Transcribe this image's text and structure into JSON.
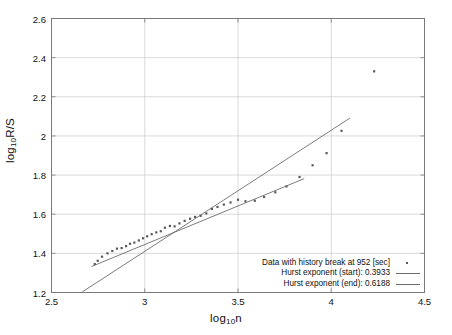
{
  "chart_data": {
    "type": "scatter",
    "title": "",
    "xlabel": "log10n",
    "ylabel": "log10R/S",
    "xlim": [
      2.5,
      4.5
    ],
    "ylim": [
      1.2,
      2.6
    ],
    "xticks": [
      "2.5",
      "3",
      "3.5",
      "4",
      "4.5"
    ],
    "xtick_values": [
      2.5,
      3,
      3.5,
      4,
      4.5
    ],
    "yticks": [
      "1.2",
      "1.4",
      "1.6",
      "1.8",
      "2",
      "2.2",
      "2.4",
      "2.6"
    ],
    "ytick_values": [
      1.2,
      1.4,
      1.6,
      1.8,
      2.0,
      2.2,
      2.4,
      2.6
    ],
    "grid": true,
    "legend_position": "lower right",
    "marker_color": "#5a5a5a",
    "line_color": "#6d6d6d",
    "series": [
      {
        "name": "Data with history break at 952 [sec]",
        "type": "scatter",
        "marker": "square-dot",
        "points": [
          [
            2.732,
            1.345
          ],
          [
            2.748,
            1.362
          ],
          [
            2.771,
            1.383
          ],
          [
            2.8,
            1.4
          ],
          [
            2.826,
            1.412
          ],
          [
            2.851,
            1.424
          ],
          [
            2.876,
            1.427
          ],
          [
            2.9,
            1.437
          ],
          [
            2.921,
            1.449
          ],
          [
            2.944,
            1.455
          ],
          [
            2.968,
            1.466
          ],
          [
            2.991,
            1.477
          ],
          [
            3.013,
            1.487
          ],
          [
            3.037,
            1.498
          ],
          [
            3.062,
            1.507
          ],
          [
            3.086,
            1.513
          ],
          [
            3.108,
            1.531
          ],
          [
            3.135,
            1.54
          ],
          [
            3.16,
            1.538
          ],
          [
            3.186,
            1.553
          ],
          [
            3.214,
            1.566
          ],
          [
            3.243,
            1.577
          ],
          [
            3.27,
            1.586
          ],
          [
            3.3,
            1.592
          ],
          [
            3.33,
            1.604
          ],
          [
            3.36,
            1.627
          ],
          [
            3.39,
            1.637
          ],
          [
            3.424,
            1.649
          ],
          [
            3.46,
            1.66
          ],
          [
            3.5,
            1.674
          ],
          [
            3.54,
            1.666
          ],
          [
            3.59,
            1.669
          ],
          [
            3.64,
            1.688
          ],
          [
            3.7,
            1.712
          ],
          [
            3.76,
            1.742
          ],
          [
            3.83,
            1.79
          ],
          [
            3.9,
            1.85
          ],
          [
            3.975,
            1.912
          ],
          [
            4.055,
            2.026
          ],
          [
            4.23,
            2.33
          ]
        ]
      },
      {
        "name": "Hurst exponent (start): 0.3933",
        "type": "line",
        "slope": 0.3933,
        "segment": [
          [
            2.715,
            1.333
          ],
          [
            3.855,
            1.782
          ]
        ]
      },
      {
        "name": "Hurst exponent (end): 0.6188",
        "type": "line",
        "slope": 0.6188,
        "segment": [
          [
            2.665,
            1.203
          ],
          [
            4.1,
            2.091
          ]
        ]
      }
    ]
  },
  "legend": {
    "items": [
      {
        "label": "Data with history break at 952 [sec]",
        "key": "marker"
      },
      {
        "label": "Hurst exponent (start): 0.3933",
        "key": "line"
      },
      {
        "label": "Hurst exponent (end): 0.6188",
        "key": "line"
      }
    ]
  },
  "axes": {
    "xlabel_main": "log",
    "xlabel_sub": "10",
    "xlabel_tail": "n",
    "ylabel_main": "log",
    "ylabel_sub": "10",
    "ylabel_tail": "R/S"
  }
}
